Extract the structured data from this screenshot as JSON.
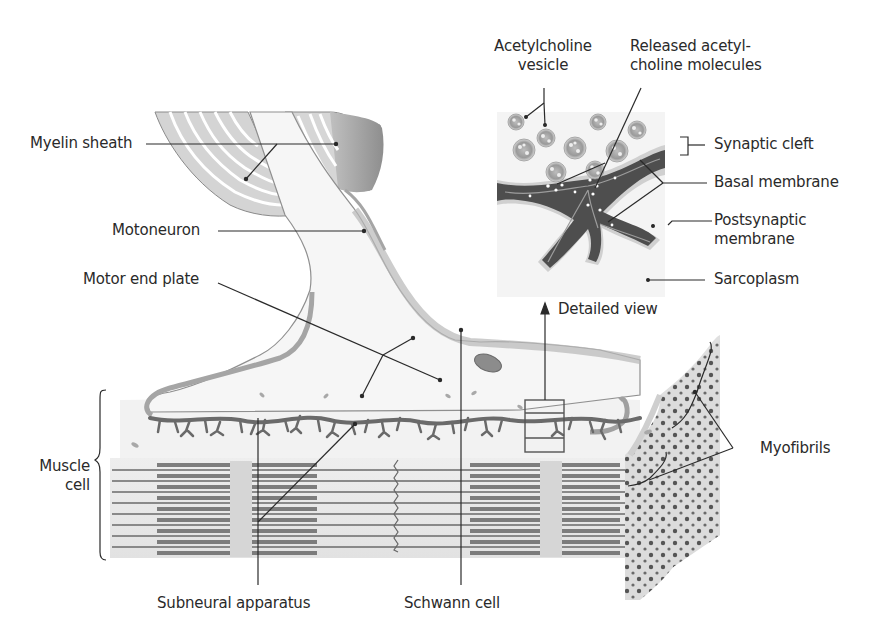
{
  "figure": {
    "colors": {
      "background": "#ffffff",
      "label_text": "#2a2a2a",
      "leader_line": "#2a2a2a",
      "myelin_light": "#e6e6e6",
      "myelin_dark": "#8a8a8a",
      "axon_fill": "#f4f4f4",
      "muscle_band": "#d9d9d9",
      "myofilament_dark": "#5a5a5a",
      "membrane_dark": "#4a4a4a",
      "myofibril_dot": "#555555"
    }
  },
  "labels": {
    "myelin_sheath": "Myelin sheath",
    "motoneuron": "Motoneuron",
    "motor_end_plate": "Motor end plate",
    "muscle_cell_line1": "Muscle",
    "muscle_cell_line2": "cell",
    "subneural_apparatus": "Subneural apparatus",
    "schwann_cell": "Schwann cell",
    "myofibrils": "Myofibrils",
    "acetylcholine_vesicle_line1": "Acetylcholine",
    "acetylcholine_vesicle_line2": "vesicle",
    "released_acetylcholine_line1": "Released acetyl-",
    "released_acetylcholine_line2": "choline molecules",
    "synaptic_cleft": "Synaptic cleft",
    "basal_membrane": "Basal membrane",
    "postsynaptic_membrane_line1": "Postsynaptic",
    "postsynaptic_membrane_line2": "membrane",
    "sarcoplasm": "Sarcoplasm",
    "detailed_view": "Detailed view"
  }
}
